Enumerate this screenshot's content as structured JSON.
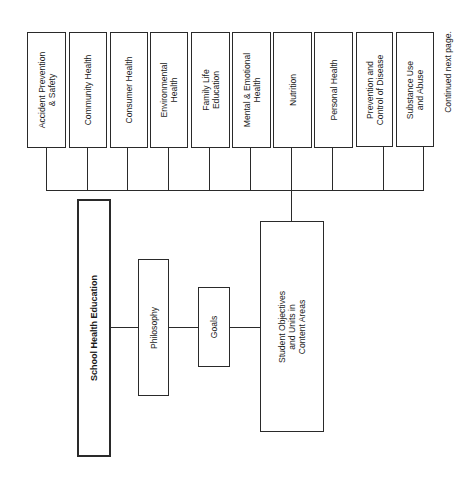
{
  "diagram": {
    "content_areas": [
      {
        "label": "Accident Prevention\n& Safety"
      },
      {
        "label": "Community Health"
      },
      {
        "label": "Consumer Health"
      },
      {
        "label": "Environmental\nHealth"
      },
      {
        "label": "Family Life\nEducation"
      },
      {
        "label": "Mental & Emotional\nHealth"
      },
      {
        "label": "Nutrition"
      },
      {
        "label": "Personal Health"
      },
      {
        "label": "Prevention and\nControl of Disease"
      },
      {
        "label": "Substance Use\nand Abuse"
      }
    ],
    "root": {
      "label": "School Health Education"
    },
    "philosophy": {
      "label": "Philosophy"
    },
    "goals": {
      "label": "Goals"
    },
    "objectives": {
      "label": "Student Objectives\nand Units in\nContent Areas"
    },
    "footnote": "Continued next page."
  }
}
